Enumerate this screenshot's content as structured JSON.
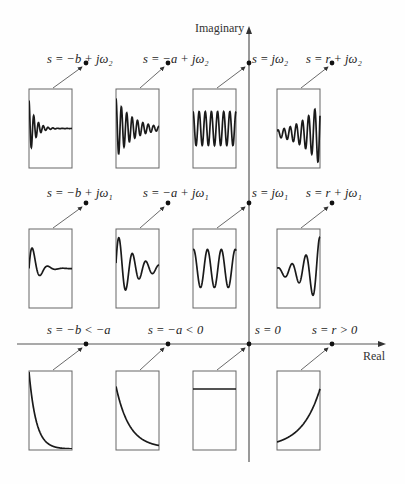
{
  "axes": {
    "vertical_label": "Imaginary",
    "horizontal_label": "Real"
  },
  "rows": [
    {
      "name": "omega2",
      "points": [
        {
          "label": "s = −b + jω₂",
          "response": "fast-decaying-high-freq"
        },
        {
          "label": "s = −a + jω₂",
          "response": "slow-decaying-high-freq"
        },
        {
          "label": "s = jω₂",
          "response": "sustained-high-freq"
        },
        {
          "label": "s = r + jω₂",
          "response": "growing-high-freq"
        }
      ]
    },
    {
      "name": "omega1",
      "points": [
        {
          "label": "s = −b + jω₁",
          "response": "fast-decaying-low-freq"
        },
        {
          "label": "s = −a + jω₁",
          "response": "slow-decaying-low-freq"
        },
        {
          "label": "s = jω₁",
          "response": "sustained-low-freq"
        },
        {
          "label": "s = r + jω₁",
          "response": "growing-low-freq"
        }
      ]
    },
    {
      "name": "real",
      "points": [
        {
          "label": "s = −b < −a",
          "response": "fast-exponential-decay"
        },
        {
          "label": "s = −a < 0",
          "response": "slow-exponential-decay"
        },
        {
          "label": "s = 0",
          "response": "constant"
        },
        {
          "label": "s = r > 0",
          "response": "exponential-growth"
        }
      ]
    }
  ],
  "colors": {
    "axis": "#555555",
    "curve": "#1a1a1a",
    "box": "#666666",
    "text": "#222222"
  }
}
